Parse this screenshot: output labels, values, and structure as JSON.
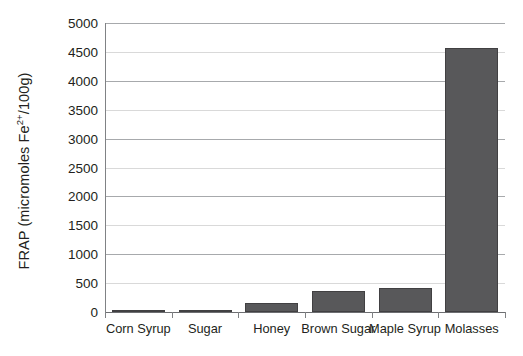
{
  "chart_data": {
    "type": "bar",
    "title": "",
    "subtitle": "",
    "xlabel": "",
    "ylabel": "FRAP (micromoles Fe 2+ /100g)",
    "ylabel_parts": {
      "prefix": "FRAP (micromoles Fe",
      "superscript": "2+",
      "suffix": "/100g)"
    },
    "categories": [
      "Corn Syrup",
      "Sugar",
      "Honey",
      "Brown Sugar",
      "Maple Syrup",
      "Molasses"
    ],
    "values": [
      5,
      15,
      150,
      360,
      420,
      4570
    ],
    "ylim": [
      0,
      5000
    ],
    "ytick_step": 500,
    "yticks": [
      0,
      500,
      1000,
      1500,
      2000,
      2500,
      3000,
      3500,
      4000,
      4500,
      5000
    ],
    "ytick_labels": [
      "0",
      "500",
      "1000",
      "1500",
      "2000",
      "2500",
      "3000",
      "3500",
      "4000",
      "4500",
      "5000"
    ],
    "grid": true,
    "grid_axis": "y",
    "legend": false,
    "legend_position": "none",
    "series": [
      {
        "name": "FRAP",
        "values": [
          5,
          15,
          150,
          360,
          420,
          4570
        ]
      }
    ]
  },
  "style": {
    "bar_fill": "#58585a",
    "bar_edge": "#414042",
    "grid_major_color": "#a7a9ac",
    "grid_minor_color": "#d9d9d9",
    "axis_color": "#808285",
    "text_color": "#231f20",
    "background": "#ffffff"
  }
}
